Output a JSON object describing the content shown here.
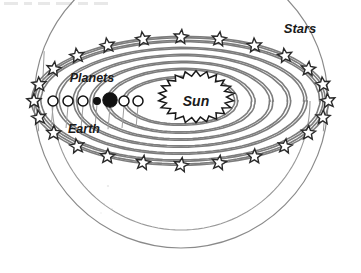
{
  "figure": {
    "caption_top": "",
    "style": "hand-drawn black-and-white line diagram",
    "background_color": "#ffffff",
    "line_color": "#7d7d7d",
    "outline_color": "#8a8a8a",
    "ink_color": "#1a1a1a"
  },
  "labels": {
    "stars": "Stars",
    "planets": "Planets",
    "earth": "Earth",
    "sun": "Sun"
  },
  "sun": {
    "name": "Sun",
    "cx": 196,
    "cy": 97,
    "rx": 38,
    "ry": 26,
    "spikes": 22,
    "fill": "#ffffff",
    "stroke": "#1a1a1a"
  },
  "celestial_sphere": {
    "name": "celestial-sphere-dome",
    "cx": 181,
    "cy": 101,
    "rx": 147,
    "ry": 147,
    "stroke": "#8a8a8a",
    "description": "large hemisphere outline enclosing the system"
  },
  "star_ring": {
    "name": "fixed-stars-ring",
    "cx": 181,
    "cy": 101,
    "rx": 147,
    "ry": 64,
    "count": 24,
    "star_size": 7.5,
    "stroke": "#2a2a2a",
    "fill": "#ffffff"
  },
  "orbits": {
    "name": "planetary-orbits",
    "cx": 181,
    "cy": 101,
    "count": 7,
    "stroke": "#7d7d7d",
    "band_width": 3.2,
    "rings": [
      {
        "index": 1,
        "rx": 56,
        "ry": 24
      },
      {
        "index": 2,
        "rx": 73,
        "ry": 32
      },
      {
        "index": 3,
        "rx": 90,
        "ry": 39
      },
      {
        "index": 4,
        "rx": 107,
        "ry": 46
      },
      {
        "index": 5,
        "rx": 124,
        "ry": 53
      },
      {
        "index": 6,
        "rx": 141,
        "ry": 60
      },
      {
        "index": 7,
        "rx": 147,
        "ry": 64
      }
    ]
  },
  "planets": [
    {
      "index": 1,
      "cx": 53,
      "cy": 101,
      "r": 5.0,
      "fill": "#ffffff",
      "highlight": false
    },
    {
      "index": 2,
      "cx": 68,
      "cy": 101,
      "r": 5.0,
      "fill": "#ffffff",
      "highlight": false
    },
    {
      "index": 3,
      "cx": 83,
      "cy": 101,
      "r": 5.0,
      "fill": "#ffffff",
      "highlight": false
    },
    {
      "index": 4,
      "cx": 97,
      "cy": 101,
      "r": 3.4,
      "fill": "#111111",
      "highlight": false
    },
    {
      "index": 5,
      "cx": 110,
      "cy": 100,
      "r": 7.2,
      "fill": "#111111",
      "highlight": true,
      "label": "Earth"
    },
    {
      "index": 6,
      "cx": 124,
      "cy": 101,
      "r": 5.0,
      "fill": "#ffffff",
      "highlight": false
    },
    {
      "index": 7,
      "cx": 138,
      "cy": 101,
      "r": 5.0,
      "fill": "#ffffff",
      "highlight": false
    }
  ],
  "label_positions": {
    "stars": {
      "x": 300,
      "y": 33
    },
    "planets": {
      "x": 92,
      "y": 82
    },
    "earth": {
      "x": 84,
      "y": 133
    },
    "sun": {
      "x": 196,
      "y": 102
    }
  }
}
